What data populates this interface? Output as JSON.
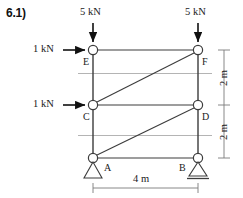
{
  "problem": {
    "label": "6.1)"
  },
  "diagram": {
    "type": "truss-free-body-diagram",
    "loads": {
      "vertical": [
        {
          "id": "load-at-E",
          "magnitude": "5 kN",
          "direction": "down",
          "applied_at": "E"
        },
        {
          "id": "load-at-F",
          "magnitude": "5 kN",
          "direction": "down",
          "applied_at": "F"
        }
      ],
      "horizontal": [
        {
          "id": "load-at-E-horizontal",
          "magnitude": "1 kN",
          "direction": "right",
          "applied_at": "E"
        },
        {
          "id": "load-at-C-horizontal",
          "magnitude": "1 kN",
          "direction": "right",
          "applied_at": "C"
        }
      ]
    },
    "joints": [
      {
        "id": "E",
        "label": "E",
        "x": 93,
        "y": 50
      },
      {
        "id": "F",
        "label": "F",
        "x": 198,
        "y": 50
      },
      {
        "id": "C",
        "label": "C",
        "x": 93,
        "y": 105
      },
      {
        "id": "D",
        "label": "D",
        "x": 198,
        "y": 105
      },
      {
        "id": "A",
        "label": "A",
        "x": 93,
        "y": 158
      },
      {
        "id": "B",
        "label": "B",
        "x": 198,
        "y": 158
      }
    ],
    "members": [
      {
        "from": "E",
        "to": "F",
        "kind": "chord"
      },
      {
        "from": "C",
        "to": "D",
        "kind": "chord"
      },
      {
        "from": "A",
        "to": "B",
        "kind": "chord"
      },
      {
        "from": "E",
        "to": "C",
        "kind": "vertical"
      },
      {
        "from": "C",
        "to": "A",
        "kind": "vertical"
      },
      {
        "from": "F",
        "to": "D",
        "kind": "vertical"
      },
      {
        "from": "D",
        "to": "B",
        "kind": "vertical"
      },
      {
        "from": "C",
        "to": "F",
        "kind": "diagonal"
      },
      {
        "from": "A",
        "to": "D",
        "kind": "diagonal"
      }
    ],
    "supports": [
      {
        "id": "support-A",
        "at": "A",
        "type": "pinned"
      },
      {
        "id": "support-B",
        "at": "B",
        "type": "roller"
      }
    ],
    "dimensions": {
      "vertical_upper": "2 m",
      "vertical_lower": "2 m",
      "horizontal_span": "4 m"
    },
    "colors": {
      "line": "#3c3c3c",
      "ruled_line": "#b4b4b4",
      "dimension_line": "#7a7a7a",
      "arrow": "#111111"
    }
  }
}
